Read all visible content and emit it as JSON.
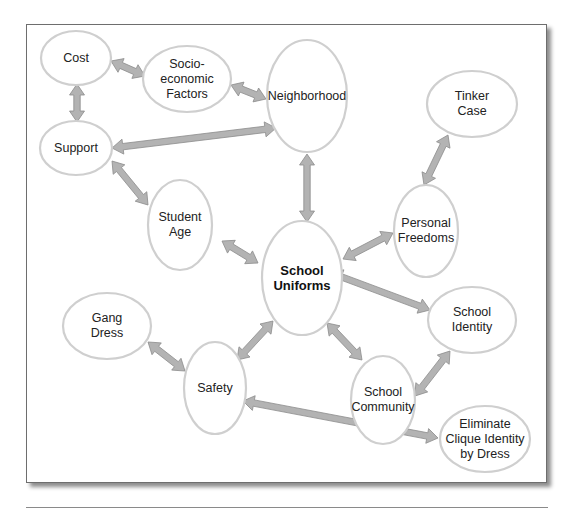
{
  "diagram": {
    "type": "concept-map",
    "colors": {
      "node_fill": "#ffffff",
      "node_stroke": "#cfcfcf",
      "arrow_fill": "#b3b3b3",
      "arrow_stroke": "#8c8c8c",
      "frame_border": "#6e6e6e"
    },
    "nodes": [
      {
        "id": "cost",
        "label": "Cost",
        "cx": 76,
        "cy": 58,
        "rx": 35,
        "ry": 27
      },
      {
        "id": "socio",
        "label": "Socio-\neconomic\nFactors",
        "cx": 187,
        "cy": 79,
        "rx": 44,
        "ry": 33
      },
      {
        "id": "neighborhood",
        "label": "Neighborhood",
        "cx": 307,
        "cy": 96,
        "rx": 40,
        "ry": 56
      },
      {
        "id": "tinker",
        "label": "Tinker\nCase",
        "cx": 472,
        "cy": 104,
        "rx": 45,
        "ry": 33
      },
      {
        "id": "support",
        "label": "Support",
        "cx": 76,
        "cy": 148,
        "rx": 36,
        "ry": 27
      },
      {
        "id": "student_age",
        "label": "Student\nAge",
        "cx": 180,
        "cy": 225,
        "rx": 32,
        "ry": 45
      },
      {
        "id": "personal_freedoms",
        "label": "Personal\nFreedoms",
        "cx": 426,
        "cy": 231,
        "rx": 32,
        "ry": 46
      },
      {
        "id": "school_uniforms",
        "label": "School\nUniforms",
        "cx": 302,
        "cy": 278,
        "rx": 40,
        "ry": 57,
        "bold": true
      },
      {
        "id": "school_identity",
        "label": "School\nIdentity",
        "cx": 472,
        "cy": 320,
        "rx": 44,
        "ry": 33
      },
      {
        "id": "gang_dress",
        "label": "Gang\nDress",
        "cx": 107,
        "cy": 326,
        "rx": 44,
        "ry": 33
      },
      {
        "id": "safety",
        "label": "Safety",
        "cx": 215,
        "cy": 388,
        "rx": 31,
        "ry": 46
      },
      {
        "id": "school_community",
        "label": "School\nCommunity",
        "cx": 383,
        "cy": 400,
        "rx": 32,
        "ry": 44
      },
      {
        "id": "eliminate_clique",
        "label": "Eliminate\nClique Identity\nby Dress",
        "cx": 485,
        "cy": 439,
        "rx": 45,
        "ry": 33
      }
    ],
    "edges": [
      {
        "from": "cost",
        "to": "socio",
        "x1": 111,
        "y1": 61,
        "x2": 145,
        "y2": 76
      },
      {
        "from": "cost",
        "to": "support",
        "x1": 77,
        "y1": 84,
        "x2": 77,
        "y2": 122
      },
      {
        "from": "socio",
        "to": "neighborhood",
        "x1": 231,
        "y1": 85,
        "x2": 266,
        "y2": 99
      },
      {
        "from": "support",
        "to": "neighborhood",
        "x1": 112,
        "y1": 148,
        "x2": 276,
        "y2": 128
      },
      {
        "from": "support",
        "to": "student_age",
        "x1": 112,
        "y1": 161,
        "x2": 148,
        "y2": 205
      },
      {
        "from": "neighborhood",
        "to": "school_uniforms",
        "x1": 307,
        "y1": 154,
        "x2": 307,
        "y2": 222
      },
      {
        "from": "tinker",
        "to": "personal_freedoms",
        "x1": 448,
        "y1": 135,
        "x2": 424,
        "y2": 185
      },
      {
        "from": "student_age",
        "to": "school_uniforms",
        "x1": 222,
        "y1": 241,
        "x2": 258,
        "y2": 263
      },
      {
        "from": "personal_freedoms",
        "to": "school_uniforms",
        "x1": 393,
        "y1": 233,
        "x2": 343,
        "y2": 259
      },
      {
        "from": "school_uniforms",
        "to": "school_identity",
        "x1": 331,
        "y1": 273,
        "x2": 430,
        "y2": 310
      },
      {
        "from": "school_uniforms",
        "to": "safety",
        "x1": 273,
        "y1": 321,
        "x2": 237,
        "y2": 360
      },
      {
        "from": "gang_dress",
        "to": "safety",
        "x1": 148,
        "y1": 342,
        "x2": 185,
        "y2": 371
      },
      {
        "from": "school_uniforms",
        "to": "school_community",
        "x1": 327,
        "y1": 323,
        "x2": 362,
        "y2": 360
      },
      {
        "from": "school_identity",
        "to": "school_community",
        "x1": 450,
        "y1": 351,
        "x2": 415,
        "y2": 396
      },
      {
        "from": "safety",
        "to": "eliminate_clique",
        "x1": 243,
        "y1": 401,
        "x2": 438,
        "y2": 438
      }
    ]
  }
}
